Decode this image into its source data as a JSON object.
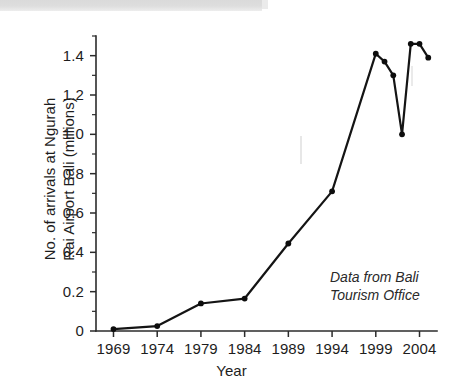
{
  "chart_data": {
    "type": "line",
    "title": "",
    "subtitle": "",
    "xlabel": "Year",
    "ylabel": "No. of arrivals at Ngurah Rai Airport Bali (millions)",
    "ylabel_lines": [
      "No. of arrivals at Ngurah",
      "Rai Airport Bali (millions)"
    ],
    "xlim": [
      1967,
      2006
    ],
    "ylim": [
      0,
      1.5
    ],
    "grid": false,
    "legend": null,
    "x_tick_labels": [
      "1969",
      "1974",
      "1979",
      "1984",
      "1989",
      "1994",
      "1999",
      "2004"
    ],
    "x_tick_values": [
      1969,
      1974,
      1979,
      1984,
      1989,
      1994,
      1999,
      2004
    ],
    "y_tick_labels": [
      "0",
      "0.2",
      "0.4",
      "0.6",
      "0.8",
      "1.0",
      "1.2",
      "1.4"
    ],
    "y_tick_values": [
      0,
      0.2,
      0.4,
      0.6,
      0.8,
      1.0,
      1.2,
      1.4
    ],
    "y_minor_step": 0.1,
    "x": [
      1969,
      1974,
      1979,
      1984,
      1989,
      1994,
      1999,
      2000,
      2001,
      2002,
      2003,
      2004,
      2005
    ],
    "values": [
      0.01,
      0.025,
      0.14,
      0.165,
      0.445,
      0.71,
      1.41,
      1.37,
      1.3,
      1.0,
      1.46,
      1.46,
      1.39
    ],
    "series": [
      {
        "name": "Arrivals at Ngurah Rai Airport Bali",
        "x": [
          1969,
          1974,
          1979,
          1984,
          1989,
          1994,
          1999,
          2000,
          2001,
          2002,
          2003,
          2004,
          2005
        ],
        "values": [
          0.01,
          0.025,
          0.14,
          0.165,
          0.445,
          0.71,
          1.41,
          1.37,
          1.3,
          1.0,
          1.46,
          1.46,
          1.39
        ],
        "marker": "filled-circle",
        "color": "#111111"
      }
    ],
    "annotations": [
      {
        "name": "source-note",
        "text": "Data from Bali Tourism Office",
        "lines": [
          "Data from Bali",
          "Tourism Office"
        ],
        "style": "italic",
        "x": 1999,
        "y": 0.2
      }
    ],
    "colors": {
      "line": "#111111",
      "marker": "#0d0d0d",
      "axis": "#2b2b2b",
      "background": "#ffffff"
    }
  },
  "axes": {
    "x_title": "Year",
    "y_title_line1": "No. of arrivals at Ngurah",
    "y_title_line2": "Rai Airport Bali (millions)"
  },
  "note": {
    "line1": "Data from Bali",
    "line2": "Tourism Office"
  }
}
